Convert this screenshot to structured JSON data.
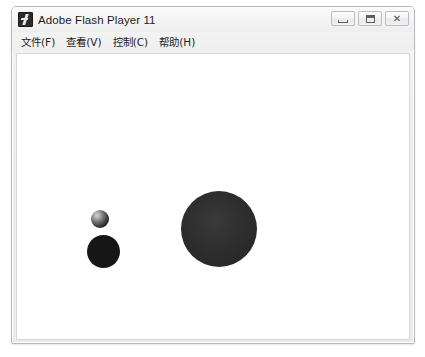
{
  "window": {
    "title": "Adobe Flash Player 11",
    "icon": "flash-icon",
    "buttons": [
      {
        "name": "minimize-button",
        "label": "Minimize",
        "glyph": "minimize-icon"
      },
      {
        "name": "maximize-button",
        "label": "Maximize",
        "glyph": "maximize-icon"
      },
      {
        "name": "close-button",
        "label": "Close",
        "glyph": "close-icon"
      }
    ]
  },
  "menubar": {
    "items": [
      {
        "label": "文件(F)",
        "name": "menu-file"
      },
      {
        "label": "查看(V)",
        "name": "menu-view"
      },
      {
        "label": "控制(C)",
        "name": "menu-control"
      },
      {
        "label": "帮助(H)",
        "name": "menu-help"
      }
    ]
  },
  "stage": {
    "background_color": "#ffffff",
    "shapes": [
      {
        "name": "small-glossy-sphere",
        "kind": "sphere",
        "x": 90,
        "y": 206,
        "diameter": 18,
        "color": "#2e2e2e",
        "highlight_color": "#d2d2d2"
      },
      {
        "name": "black-ball",
        "kind": "circle",
        "x": 86,
        "y": 231,
        "diameter": 33,
        "color": "#161616"
      },
      {
        "name": "large-dark-ball",
        "kind": "circle",
        "x": 180,
        "y": 187,
        "diameter": 76,
        "color": "#2e2e2e"
      }
    ]
  },
  "theme": {
    "window_border": "#b6b9bd",
    "titlebar_top": "#fbfbfb",
    "titlebar_bottom": "#eeeeee",
    "text_color": "#1d1d1d"
  }
}
